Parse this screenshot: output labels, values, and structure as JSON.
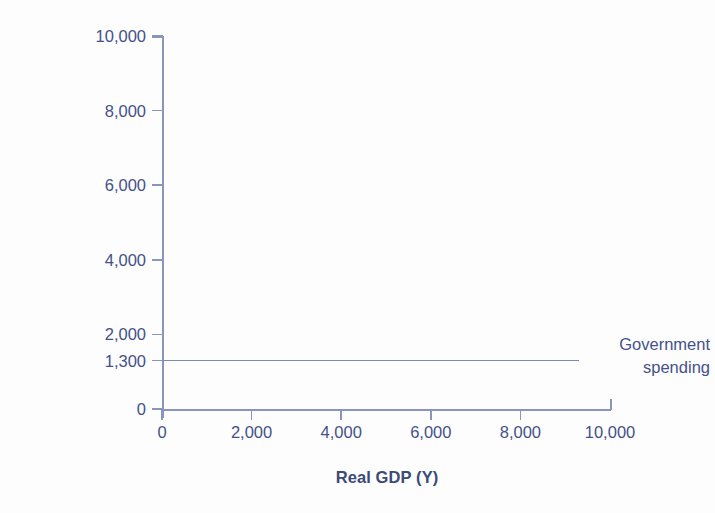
{
  "chart_data": {
    "type": "line",
    "title": "",
    "xlabel": "Real GDP (Y)",
    "ylabel": "Aggregate Expenditure",
    "xlim": [
      0,
      10000
    ],
    "ylim": [
      0,
      10000
    ],
    "grid": false,
    "legend_position": "inline-right-annotation",
    "x_ticks": [
      {
        "value": 0,
        "label": "0"
      },
      {
        "value": 2000,
        "label": "2,000"
      },
      {
        "value": 4000,
        "label": "4,000"
      },
      {
        "value": 6000,
        "label": "6,000"
      },
      {
        "value": 8000,
        "label": "8,000"
      },
      {
        "value": 10000,
        "label": "10,000"
      }
    ],
    "y_ticks": [
      {
        "value": 0,
        "label": "0"
      },
      {
        "value": 1300,
        "label": "1,300"
      },
      {
        "value": 2000,
        "label": "2,000"
      },
      {
        "value": 4000,
        "label": "4,000"
      },
      {
        "value": 6000,
        "label": "6,000"
      },
      {
        "value": 8000,
        "label": "8,000"
      },
      {
        "value": 10000,
        "label": "10,000"
      }
    ],
    "series": [
      {
        "name": "Government spending",
        "type": "horizontal-line",
        "value": 1300,
        "x": [
          0,
          9300
        ],
        "values": [
          1300,
          1300
        ],
        "annotation_line1": "Government",
        "annotation_line2": "spending"
      }
    ],
    "colors": {
      "axis": "#8995bb",
      "tick_label": "#44518a",
      "axis_title": "#3b4a78",
      "series_line": "#7c8ab4",
      "background": "#fdfdfd"
    }
  }
}
